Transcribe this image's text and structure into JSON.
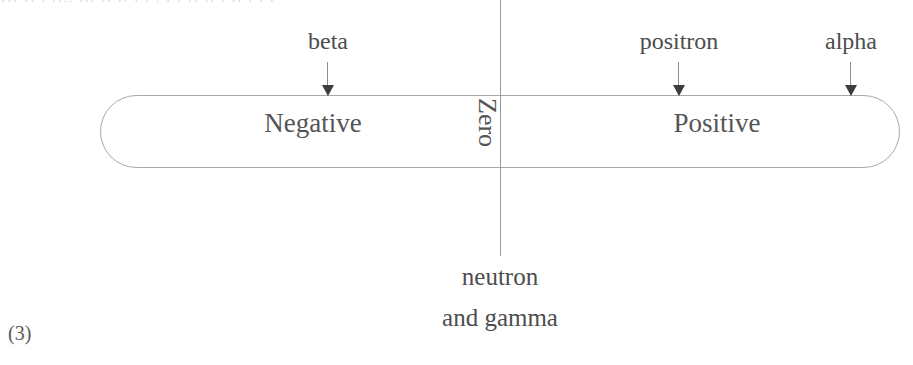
{
  "page": {
    "background_color": "#ffffff",
    "ink_color": "#4a4a4a",
    "top_cut_off_text": "Ill Il  l  ll.. lll  ll   ll l  l .  l l    ll  ll   l  ll   l     l l",
    "question_number": "(3)"
  },
  "diagram": {
    "type": "charge-number-line",
    "bar": {
      "left_label": "Negative",
      "right_label": "Positive",
      "center_label": "Zero",
      "center_label_rotation_deg": 90,
      "border_color": "#a8a8a8",
      "x_start_px": 100,
      "x_end_px": 900,
      "y_top_px": 95,
      "y_bottom_px": 168
    },
    "axis": {
      "x_px": 500,
      "y_top_px": 0,
      "y_bottom_px": 256,
      "color": "#9a9a9a"
    },
    "top_pointers": [
      {
        "label": "beta",
        "x_px": 328,
        "label_y_px": 28,
        "arrow_top_px": 62,
        "arrow_bottom_px": 95
      },
      {
        "label": "positron",
        "x_px": 679,
        "label_y_px": 28,
        "arrow_top_px": 62,
        "arrow_bottom_px": 95
      },
      {
        "label": "alpha",
        "x_px": 851,
        "label_y_px": 28,
        "arrow_top_px": 62,
        "arrow_bottom_px": 95
      }
    ],
    "bottom_label_lines": [
      "neutron",
      "and gamma"
    ]
  }
}
